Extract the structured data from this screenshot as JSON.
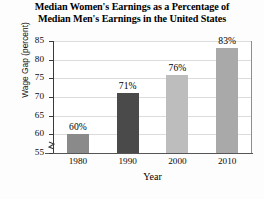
{
  "chart_data": {
    "type": "bar",
    "title": "Median Women's Earnings as a Percentage of Median Men's Earnings in the United States",
    "title_lines": [
      "Median Women's Earnings as a Percentage of",
      "Median Men's Earnings in the United States"
    ],
    "xlabel": "Year",
    "ylabel": "Wage Gap (percent)",
    "categories": [
      "1980",
      "1990",
      "2000",
      "2010"
    ],
    "values": [
      60,
      71,
      76,
      83
    ],
    "data_labels": [
      "60%",
      "71%",
      "76%",
      "83%"
    ],
    "bar_colors": [
      "#8a8a8a",
      "#4a4a4a",
      "#bdbdbd",
      "#a9a9a9"
    ],
    "ylim": [
      55,
      85
    ],
    "yticks": [
      55,
      60,
      65,
      70,
      75,
      80,
      85
    ],
    "ytick_labels": [
      "55",
      "60",
      "65",
      "70",
      "75",
      "80",
      "85"
    ],
    "grid": true,
    "grid_axis": "y",
    "legend": null,
    "axis_break": true,
    "axis_break_note": "y-axis broken below 55"
  }
}
